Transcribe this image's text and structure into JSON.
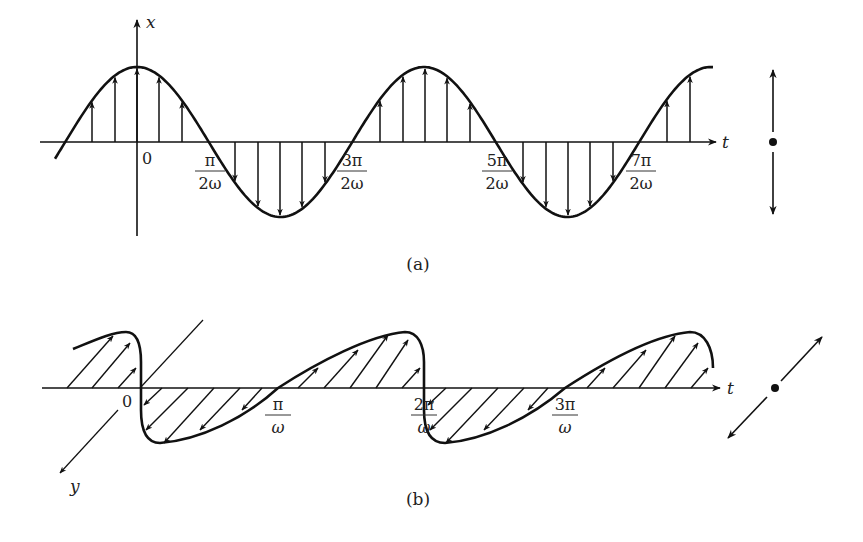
{
  "colors": {
    "ink": "#111111",
    "label": "#333333",
    "background": "#ffffff"
  },
  "panel_a": {
    "caption": "(a)",
    "y_axis_label": "x",
    "t_axis_label": "t",
    "origin_label": "0",
    "ticks": [
      {
        "num": "π",
        "den": "2ω",
        "x": 210
      },
      {
        "num": "3π",
        "den": "2ω",
        "x": 352
      },
      {
        "num": "5π",
        "den": "2ω",
        "x": 497
      },
      {
        "num": "7π",
        "den": "2ω",
        "x": 641
      }
    ],
    "description": "Linearly polarized wave: field vector oscillates along x as cos(ωt)",
    "indicator": "vertical double-headed arrow with center dot"
  },
  "panel_b": {
    "caption": "(b)",
    "y_axis_label": "y",
    "t_axis_label": "t",
    "origin_label": "0",
    "ticks": [
      {
        "num": "π",
        "den": "ω",
        "x": 278
      },
      {
        "num": "2π",
        "den": "ω",
        "x": 424
      },
      {
        "num": "3π",
        "den": "ω",
        "x": 565
      }
    ],
    "description": "Linearly polarized wave along y drawn in perspective: vectors oscillate along the oblique y axis",
    "indicator": "diagonal double-headed arrow with center dot"
  }
}
